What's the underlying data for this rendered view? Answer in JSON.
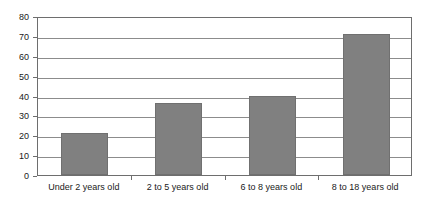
{
  "chart_data": {
    "type": "bar",
    "title": "",
    "subtitle": "",
    "xlabel": "",
    "ylabel": "",
    "categories": [
      "Under 2 years old",
      "2 to 5 years old",
      "6 to 8 years old",
      "8 to 18 years old"
    ],
    "values": [
      21,
      36,
      40,
      71
    ],
    "ylim": [
      0,
      80
    ],
    "ytick_labels": [
      "0",
      "10",
      "20",
      "30",
      "40",
      "50",
      "60",
      "70",
      "80"
    ],
    "ytick_values": [
      0,
      10,
      20,
      30,
      40,
      50,
      60,
      70,
      80
    ],
    "grid": true,
    "legend": false,
    "legend_position": "none",
    "annotations": [],
    "colors": {
      "bar_fill": "#808080",
      "bar_border": "#707070",
      "gridline": "#8c8c8c",
      "axis": "#6e6e6e",
      "plot_background": "#ffffff",
      "text": "#1a1a1a"
    }
  }
}
